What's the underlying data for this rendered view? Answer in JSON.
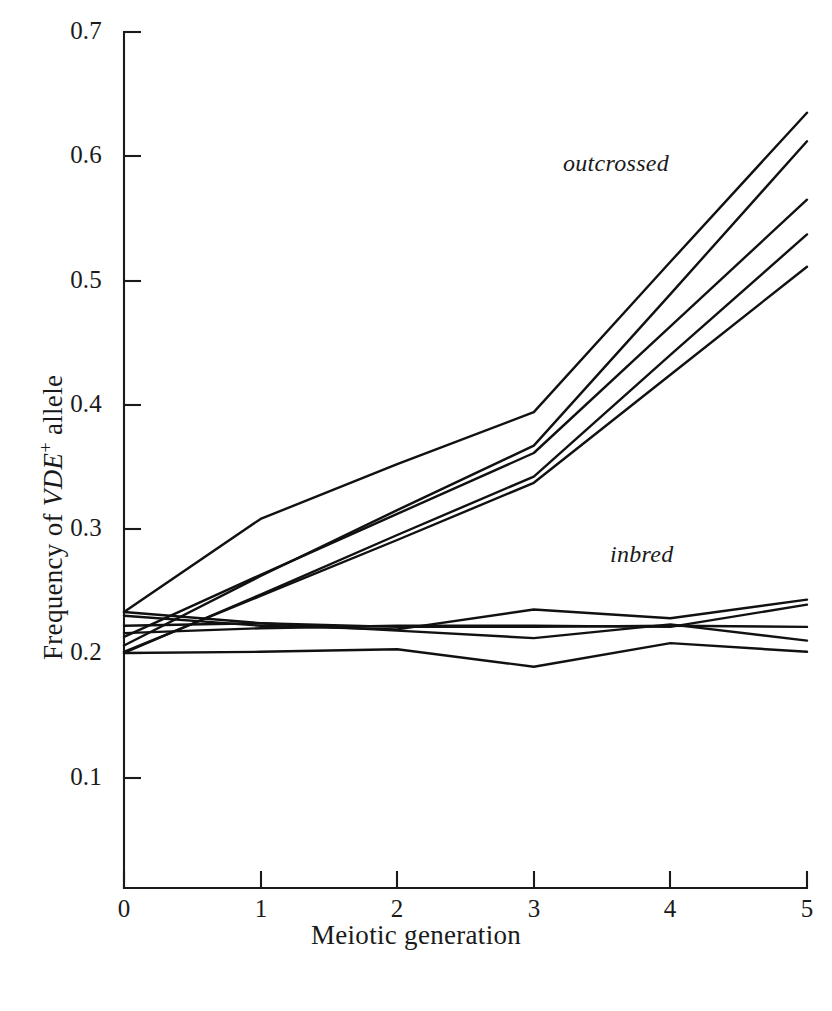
{
  "chart_data": {
    "type": "line",
    "title": "",
    "xlabel": "Meiotic generation",
    "ylabel": "Frequency of VDE+ allele",
    "xlim": [
      0,
      5
    ],
    "ylim": [
      0,
      0.7
    ],
    "grid": false,
    "legend": "inline-annotations",
    "x": [
      0,
      1,
      2,
      3,
      4,
      5
    ],
    "xticks": [
      "0",
      "1",
      "2",
      "3",
      "4",
      "5"
    ],
    "yticks": [
      "0.1",
      "0.2",
      "0.3",
      "0.4",
      "0.5",
      "0.6",
      "0.7"
    ],
    "annotations": [
      {
        "text": "outcrossed",
        "x": 3.1,
        "y": 0.615,
        "style": "italic"
      },
      {
        "text": "inbred",
        "x": 3.2,
        "y": 0.285,
        "style": "italic"
      }
    ],
    "groups": [
      {
        "name": "outcrossed",
        "label": "outcrossed",
        "color": "#111111",
        "series": [
          {
            "name": "outcrossed-1",
            "values": [
              0.233,
              0.308,
              0.352,
              0.394,
              0.515,
              0.635
            ]
          },
          {
            "name": "outcrossed-2",
            "values": [
              0.206,
              0.262,
              0.315,
              0.367,
              0.489,
              0.612
            ]
          },
          {
            "name": "outcrossed-3",
            "values": [
              0.213,
              0.263,
              0.312,
              0.361,
              0.463,
              0.565
            ]
          },
          {
            "name": "outcrossed-4",
            "values": [
              0.2,
              0.247,
              0.295,
              0.342,
              0.44,
              0.537
            ]
          },
          {
            "name": "outcrossed-5",
            "values": [
              0.201,
              0.246,
              0.291,
              0.337,
              0.424,
              0.511
            ]
          }
        ]
      },
      {
        "name": "inbred",
        "label": "inbred",
        "color": "#111111",
        "series": [
          {
            "name": "inbred-1",
            "values": [
              0.23,
              0.222,
              0.219,
              0.235,
              0.228,
              0.243
            ]
          },
          {
            "name": "inbred-2",
            "values": [
              0.216,
              0.22,
              0.222,
              0.222,
              0.221,
              0.239
            ]
          },
          {
            "name": "inbred-3",
            "values": [
              0.222,
              0.224,
              0.221,
              0.221,
              0.222,
              0.221
            ]
          },
          {
            "name": "inbred-4",
            "values": [
              0.233,
              0.224,
              0.218,
              0.212,
              0.223,
              0.21
            ]
          },
          {
            "name": "inbred-5",
            "values": [
              0.2,
              0.201,
              0.203,
              0.189,
              0.208,
              0.201
            ]
          }
        ]
      }
    ]
  },
  "axes": {
    "x": {
      "title": "Meiotic generation",
      "ticks": [
        "0",
        "1",
        "2",
        "3",
        "4",
        "5"
      ]
    },
    "y": {
      "title_prefix": "Frequency of ",
      "title_italic": "VDE",
      "title_sup": "+",
      "title_suffix": " allele",
      "ticks": [
        "0.7",
        "0.6",
        "0.5",
        "0.4",
        "0.3",
        "0.2",
        "0.1"
      ]
    }
  }
}
